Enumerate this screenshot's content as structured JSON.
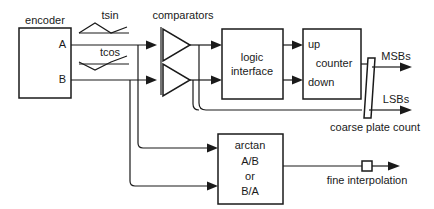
{
  "diagram": {
    "colors": {
      "stroke": "#1a1a1a",
      "fill": "#ffffff",
      "background": "#ffffff"
    },
    "blocks": {
      "encoder": {
        "label": "encoder",
        "port_a": "A",
        "port_b": "B"
      },
      "comparators": {
        "label": "comparators"
      },
      "logic_interface": {
        "line1": "logic",
        "line2": "interface"
      },
      "counter": {
        "port_up": "up",
        "label": "counter",
        "port_down": "down"
      },
      "arctan": {
        "line1": "arctan",
        "line2": "A/B",
        "line3": "or",
        "line4": "B/A"
      }
    },
    "waveforms": {
      "tsin": {
        "label": "tsin",
        "shape": "triangle-peak"
      },
      "tcos": {
        "label": "tcos",
        "shape": "triangle-valley"
      }
    },
    "outputs": {
      "msbs": "MSBs",
      "lsbs": "LSBs",
      "coarse": "coarse plate count",
      "fine": "fine interpolation"
    }
  }
}
